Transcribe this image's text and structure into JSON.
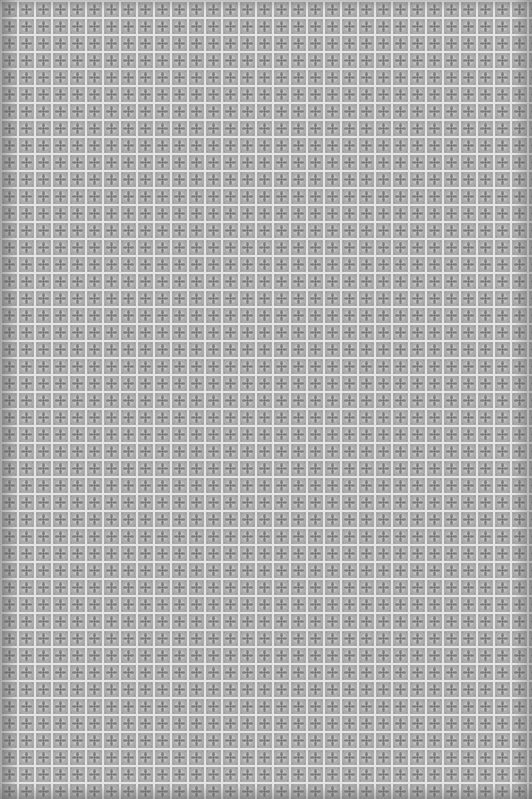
{
  "image": {
    "description": "Grayscale seamless tiled texture with square grid of light lines and small four-petal medallion motifs in each cell",
    "tile_size_px": 17,
    "colors": {
      "background": "#b4b4b4",
      "grid_line": "#e6e6e6",
      "motif_dark": "#7a7a7a",
      "motif_mid": "#9a9a9a",
      "edge_shadow": "#5a5a5a"
    }
  }
}
